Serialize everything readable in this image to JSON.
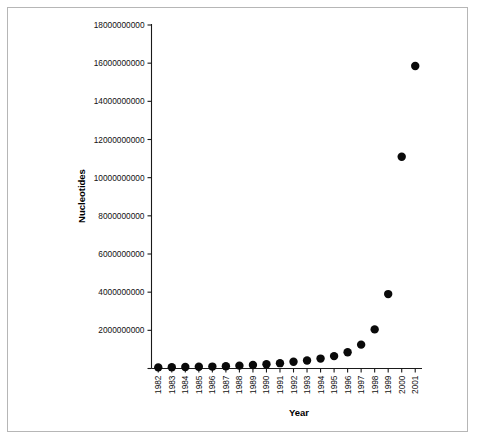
{
  "figure": {
    "background_color": "#ffffff",
    "border_color": "#b6b6b6"
  },
  "chart_data": {
    "type": "scatter",
    "title": "",
    "xlabel": "Year",
    "ylabel": "Nucleotides",
    "marker": "filled-circle",
    "marker_color": "#0a0a0a",
    "grid": false,
    "legend": "none",
    "xlim": [
      1981.5,
      2001.5
    ],
    "ylim": [
      0,
      18000000000
    ],
    "categories": [
      "1982",
      "1983",
      "1984",
      "1985",
      "1986",
      "1987",
      "1988",
      "1989",
      "1990",
      "1991",
      "1992",
      "1993",
      "1994",
      "1995",
      "1996",
      "1997",
      "1998",
      "1999",
      "2000",
      "2001"
    ],
    "x": [
      1982,
      1983,
      1984,
      1985,
      1986,
      1987,
      1988,
      1989,
      1990,
      1991,
      1992,
      1993,
      1994,
      1995,
      1996,
      1997,
      1998,
      1999,
      2000,
      2001
    ],
    "values": [
      60000000,
      70000000,
      80000000,
      90000000,
      100000000,
      120000000,
      150000000,
      180000000,
      220000000,
      280000000,
      350000000,
      420000000,
      520000000,
      650000000,
      850000000,
      1250000000,
      2050000000,
      3900000000,
      11100000000,
      15850000000
    ],
    "ytick_labels": [
      "0",
      "2000000000",
      "4000000000",
      "6000000000",
      "8000000000",
      "10000000000",
      "12000000000",
      "14000000000",
      "16000000000",
      "18000000000"
    ],
    "ytick_values": [
      0,
      2000000000,
      4000000000,
      6000000000,
      8000000000,
      10000000000,
      12000000000,
      14000000000,
      16000000000,
      18000000000
    ],
    "ytick_labels_visible": [
      "2000000000",
      "4000000000",
      "6000000000",
      "8000000000",
      "10000000000",
      "12000000000",
      "14000000000",
      "16000000000",
      "18000000000"
    ]
  }
}
